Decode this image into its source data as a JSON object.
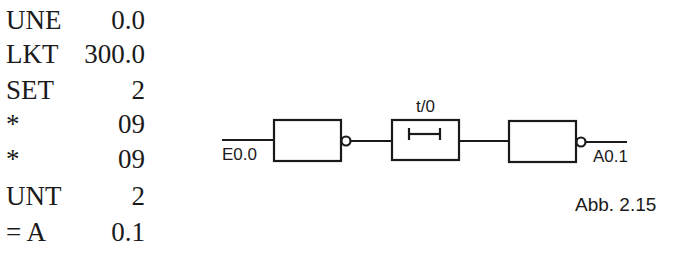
{
  "statement_list": {
    "rows": [
      {
        "op": "UNE",
        "arg": "0.0"
      },
      {
        "op": "LKT",
        "arg": "300.0"
      },
      {
        "op": "SET",
        "arg": "2"
      },
      {
        "op": "*",
        "arg": "09"
      },
      {
        "op": "*",
        "arg": "09"
      },
      {
        "op": "UNT",
        "arg": "2"
      },
      {
        "op": "= A",
        "arg": "0.1"
      }
    ]
  },
  "diagram": {
    "input_label": "E0.0",
    "timer_label": "t/0",
    "output_label": "A0.1",
    "caption": "Abb. 2.15",
    "line_color": "#1a1a1a"
  }
}
